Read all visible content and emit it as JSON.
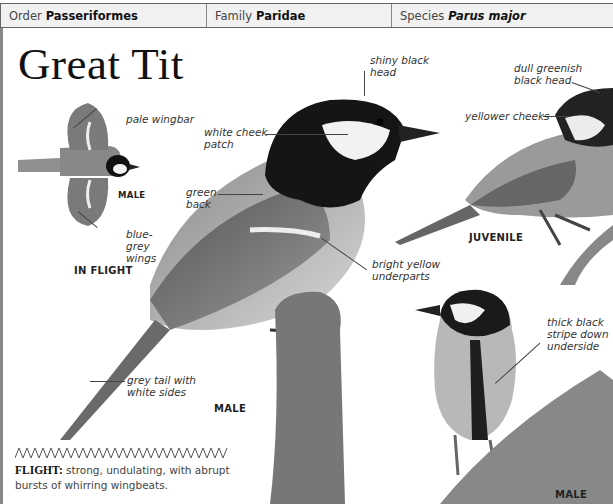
{
  "header": {
    "order_label": "Order",
    "order_value": "Passeriformes",
    "family_label": "Family",
    "family_value": "Paridae",
    "species_label": "Species",
    "species_value": "Parus major"
  },
  "title": "Great Tit",
  "in_flight": {
    "caption": "IN FLIGHT",
    "sex": "MALE",
    "labels": {
      "wingbar": "pale wingbar",
      "wings": "blue-grey wings"
    }
  },
  "main_male": {
    "caption": "MALE",
    "labels": {
      "head": "shiny black head",
      "cheek": "white cheek patch",
      "back": "green back",
      "underparts": "bright yellow underparts",
      "tail": "grey tail with white sides"
    }
  },
  "juvenile": {
    "caption": "JUVENILE",
    "labels": {
      "head": "dull greenish black head",
      "cheeks": "yellower cheeks"
    }
  },
  "front_male": {
    "caption": "MALE",
    "labels": {
      "stripe": "thick black stripe down underside"
    }
  },
  "flight": {
    "heading": "FLIGHT:",
    "description": "strong, undulating, with abrupt bursts of whirring wingbeats."
  }
}
